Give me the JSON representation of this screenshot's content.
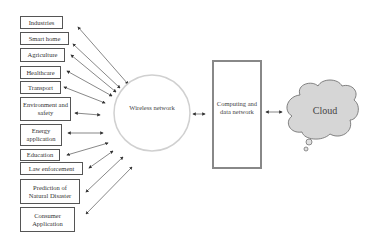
{
  "diagram": {
    "type": "network architecture",
    "application_domains": [
      {
        "label": "Industries"
      },
      {
        "label": "Smart home"
      },
      {
        "label": "Agriculture"
      },
      {
        "label": "Healthcare"
      },
      {
        "label": "Transport"
      },
      {
        "label": "Environment and safety"
      },
      {
        "label": "Energy application"
      },
      {
        "label": "Education"
      },
      {
        "label": "Law enforcement"
      },
      {
        "label": "Prediction of Natural Disaster"
      },
      {
        "label": "Consumer Application"
      }
    ],
    "hub": {
      "label": "Wireless network"
    },
    "computing": {
      "label": "Computing and data network"
    },
    "cloud": {
      "label": "Cloud"
    },
    "connections": [
      "Application domains ↔ Wireless network",
      "Wireless network ↔ Computing and data network",
      "Computing and data network ↔ Cloud"
    ],
    "colors": {
      "box_border": "#555555",
      "circle_border": "#cccccc",
      "computing_border": "#888888",
      "cloud_fill": "#d9d9d9",
      "arrow": "#444444"
    }
  }
}
